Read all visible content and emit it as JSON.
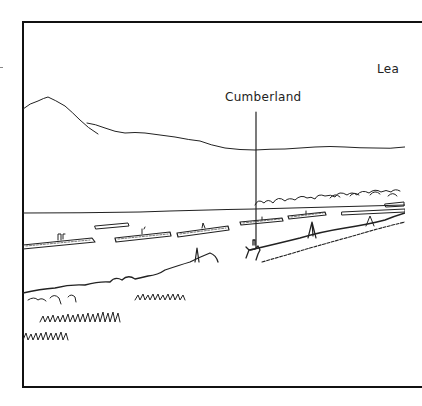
{
  "illustration": {
    "type": "landscape line drawing",
    "frame_color": "#111111",
    "ink_color": "#222222",
    "background": "#ffffff"
  },
  "labels": {
    "cumberland": "Cumberland",
    "lea_truncated": "Lea"
  },
  "features": [
    {
      "name": "mountain-ridge",
      "description": "hill line on left horizon"
    },
    {
      "name": "horizon-line",
      "description": "distant shoreline"
    },
    {
      "name": "treeline",
      "description": "trees on right shore"
    },
    {
      "name": "water",
      "description": "river / lake surface"
    },
    {
      "name": "log-rafts",
      "description": "floating logs with figures"
    },
    {
      "name": "foreground-bank",
      "description": "grassy bank with figures"
    },
    {
      "name": "pointer-line",
      "description": "leader line from Cumberland label to shore"
    }
  ]
}
